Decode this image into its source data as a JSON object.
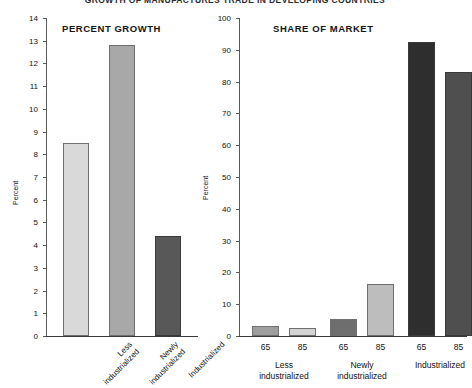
{
  "figure": {
    "master_title": "GROWTH OF MANUFACTURES TRADE IN DEVELOPING COUNTRIES"
  },
  "chart_data": [
    {
      "type": "bar",
      "title": "PERCENT GROWTH",
      "xlabel": "",
      "ylabel": "Percent",
      "ylim": [
        0,
        14
      ],
      "ytick_step": 1,
      "yticks": [
        "0",
        "1",
        "2",
        "3",
        "4",
        "5",
        "6",
        "7",
        "8",
        "9",
        "10",
        "11",
        "12",
        "13",
        "14"
      ],
      "grid": false,
      "legend": "none",
      "categories": [
        "Less industrialized",
        "Newly industrialized",
        "Industrialized"
      ],
      "values": [
        8.5,
        12.8,
        4.4
      ],
      "colors": [
        "#d9d9d9",
        "#a8a8a8",
        "#585858"
      ]
    },
    {
      "type": "bar",
      "title": "SHARE OF MARKET",
      "xlabel": "",
      "ylabel": "Percent",
      "ylim": [
        0,
        100
      ],
      "ytick_step": 10,
      "yticks": [
        "0",
        "10",
        "20",
        "30",
        "40",
        "50",
        "60",
        "70",
        "80",
        "90",
        "100"
      ],
      "grid": false,
      "legend": "none",
      "groups": [
        "Less industrialized",
        "Newly industrialized",
        "Industrialized"
      ],
      "x": [
        "65",
        "85",
        "65",
        "85",
        "65",
        "85"
      ],
      "values": [
        3.2,
        2.5,
        5.5,
        16.5,
        92.5,
        83.0
      ],
      "colors": [
        "#9e9e9e",
        "#d4d4d4",
        "#6e6e6e",
        "#bdbdbd",
        "#2e2e2e",
        "#4f4f4f"
      ]
    }
  ]
}
